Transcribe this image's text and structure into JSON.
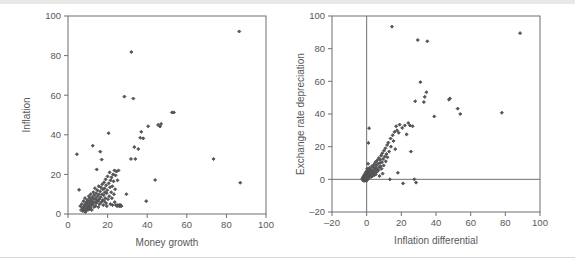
{
  "page": {
    "background": "#ffffff",
    "rule_color": "#e0e0e0",
    "text_color": "#58585a",
    "marker_color": "#545456"
  },
  "chart_data": [
    {
      "id": "money-growth-vs-inflation",
      "type": "scatter",
      "title": "",
      "xlabel": "Money growth",
      "ylabel": "Inflation",
      "xlim": [
        0,
        100
      ],
      "ylim": [
        0,
        100
      ],
      "xticks": [
        0,
        20,
        40,
        60,
        80,
        100
      ],
      "yticks": [
        0,
        20,
        40,
        60,
        80,
        100
      ],
      "grid": false,
      "legend": "none",
      "zero_lines": false,
      "points": [
        [
          4.5,
          30.2
        ],
        [
          5.6,
          12.2
        ],
        [
          6.2,
          4.0
        ],
        [
          6.6,
          2.0
        ],
        [
          7.0,
          5.0
        ],
        [
          7.3,
          3.0
        ],
        [
          7.5,
          1.5
        ],
        [
          7.8,
          6.5
        ],
        [
          8.0,
          3.5
        ],
        [
          8.2,
          2.0
        ],
        [
          8.4,
          4.5
        ],
        [
          8.6,
          8.0
        ],
        [
          8.8,
          1.0
        ],
        [
          9.0,
          5.5
        ],
        [
          9.1,
          3.0
        ],
        [
          9.3,
          2.5
        ],
        [
          9.5,
          6.0
        ],
        [
          9.6,
          4.0
        ],
        [
          9.8,
          7.0
        ],
        [
          10.0,
          2.0
        ],
        [
          10.1,
          5.0
        ],
        [
          10.3,
          3.5
        ],
        [
          10.5,
          9.0
        ],
        [
          10.6,
          6.5
        ],
        [
          10.8,
          4.0
        ],
        [
          10.9,
          2.5
        ],
        [
          11.0,
          8.0
        ],
        [
          11.2,
          5.5
        ],
        [
          11.4,
          3.0
        ],
        [
          11.5,
          10.0
        ],
        [
          11.7,
          7.0
        ],
        [
          11.8,
          4.5
        ],
        [
          12.0,
          2.0
        ],
        [
          12.2,
          6.0
        ],
        [
          12.3,
          8.5
        ],
        [
          12.5,
          34.5
        ],
        [
          12.6,
          5.0
        ],
        [
          12.8,
          11.0
        ],
        [
          13.0,
          7.5
        ],
        [
          13.1,
          3.5
        ],
        [
          13.3,
          9.5
        ],
        [
          13.5,
          6.0
        ],
        [
          13.6,
          13.0
        ],
        [
          13.8,
          4.0
        ],
        [
          14.0,
          8.0
        ],
        [
          14.2,
          10.5
        ],
        [
          14.3,
          5.5
        ],
        [
          14.5,
          22.5
        ],
        [
          14.6,
          7.0
        ],
        [
          14.8,
          12.0
        ],
        [
          15.0,
          9.0
        ],
        [
          15.2,
          6.5
        ],
        [
          15.3,
          3.5
        ],
        [
          15.5,
          14.0
        ],
        [
          15.6,
          10.0
        ],
        [
          15.8,
          7.5
        ],
        [
          16.0,
          5.0
        ],
        [
          16.2,
          11.5
        ],
        [
          16.3,
          31.5
        ],
        [
          16.5,
          8.5
        ],
        [
          16.6,
          13.5
        ],
        [
          16.8,
          6.0
        ],
        [
          17.0,
          27.5
        ],
        [
          17.2,
          10.0
        ],
        [
          17.3,
          15.0
        ],
        [
          17.5,
          7.0
        ],
        [
          17.6,
          12.5
        ],
        [
          17.8,
          4.5
        ],
        [
          18.0,
          9.5
        ],
        [
          18.2,
          16.0
        ],
        [
          18.3,
          6.5
        ],
        [
          18.5,
          13.0
        ],
        [
          18.6,
          11.0
        ],
        [
          18.8,
          8.0
        ],
        [
          19.0,
          17.5
        ],
        [
          19.2,
          5.5
        ],
        [
          19.3,
          14.5
        ],
        [
          19.5,
          10.5
        ],
        [
          19.6,
          4.0
        ],
        [
          19.8,
          12.0
        ],
        [
          20.0,
          19.0
        ],
        [
          20.2,
          7.5
        ],
        [
          20.5,
          40.8
        ],
        [
          20.6,
          15.5
        ],
        [
          20.8,
          9.0
        ],
        [
          21.0,
          21.0
        ],
        [
          21.2,
          13.5
        ],
        [
          21.4,
          5.0
        ],
        [
          21.5,
          17.0
        ],
        [
          21.8,
          11.0
        ],
        [
          22.0,
          18.5
        ],
        [
          22.2,
          8.0
        ],
        [
          22.4,
          14.0
        ],
        [
          22.5,
          4.5
        ],
        [
          22.8,
          20.0
        ],
        [
          23.0,
          16.5
        ],
        [
          23.2,
          10.0
        ],
        [
          23.5,
          22.0
        ],
        [
          23.6,
          6.0
        ],
        [
          23.8,
          12.5
        ],
        [
          24.0,
          19.5
        ],
        [
          24.2,
          4.5
        ],
        [
          24.5,
          21.5
        ],
        [
          24.8,
          4.0
        ],
        [
          25.0,
          17.0
        ],
        [
          25.2,
          4.5
        ],
        [
          25.5,
          22.0
        ],
        [
          25.8,
          4.0
        ],
        [
          26.0,
          4.5
        ],
        [
          26.3,
          4.0
        ],
        [
          26.6,
          4.5
        ],
        [
          27.0,
          4.0
        ],
        [
          28.5,
          59.3
        ],
        [
          29.5,
          10.0
        ],
        [
          31.8,
          27.8
        ],
        [
          32.0,
          81.8
        ],
        [
          33.0,
          58.3
        ],
        [
          33.5,
          33.8
        ],
        [
          34.0,
          27.8
        ],
        [
          35.5,
          32.8
        ],
        [
          36.5,
          38.5
        ],
        [
          37.0,
          41.5
        ],
        [
          38.0,
          38.2
        ],
        [
          39.5,
          6.5
        ],
        [
          40.5,
          44.3
        ],
        [
          44.0,
          17.2
        ],
        [
          45.5,
          45.0
        ],
        [
          46.5,
          44.2
        ],
        [
          47.0,
          45.5
        ],
        [
          52.5,
          51.3
        ],
        [
          53.5,
          51.3
        ],
        [
          73.5,
          27.8
        ],
        [
          86.5,
          92.2
        ],
        [
          87.0,
          15.8
        ]
      ]
    },
    {
      "id": "inflation-differential-vs-depreciation",
      "type": "scatter",
      "title": "",
      "xlabel": "Inflation differential",
      "ylabel": "Exchange rate depreciation",
      "xlim": [
        -20,
        100
      ],
      "ylim": [
        -20,
        100
      ],
      "xticks": [
        -20,
        0,
        20,
        40,
        60,
        80,
        100
      ],
      "yticks": [
        -20,
        0,
        20,
        40,
        60,
        80,
        100
      ],
      "grid": false,
      "legend": "none",
      "zero_lines": true,
      "points": [
        [
          -2.5,
          0.5
        ],
        [
          -2.2,
          -0.5
        ],
        [
          -2.0,
          1.5
        ],
        [
          -1.8,
          0.0
        ],
        [
          -1.6,
          2.0
        ],
        [
          -1.5,
          -1.0
        ],
        [
          -1.3,
          1.0
        ],
        [
          -1.2,
          3.0
        ],
        [
          -1.0,
          0.5
        ],
        [
          -0.9,
          -0.5
        ],
        [
          -0.8,
          2.5
        ],
        [
          -0.7,
          4.0
        ],
        [
          -0.6,
          1.5
        ],
        [
          -0.5,
          0.0
        ],
        [
          -0.4,
          3.5
        ],
        [
          -0.3,
          2.0
        ],
        [
          -0.2,
          -1.0
        ],
        [
          -0.1,
          5.0
        ],
        [
          0.0,
          1.0
        ],
        [
          0.1,
          3.0
        ],
        [
          0.2,
          0.5
        ],
        [
          0.3,
          6.5
        ],
        [
          0.4,
          2.5
        ],
        [
          0.5,
          4.5
        ],
        [
          0.6,
          1.5
        ],
        [
          0.7,
          0.0
        ],
        [
          0.8,
          9.5
        ],
        [
          0.9,
          3.5
        ],
        [
          1.0,
          22.3
        ],
        [
          1.1,
          2.0
        ],
        [
          1.2,
          5.5
        ],
        [
          1.3,
          1.0
        ],
        [
          1.4,
          31.3
        ],
        [
          1.5,
          4.0
        ],
        [
          1.6,
          7.0
        ],
        [
          1.8,
          2.5
        ],
        [
          2.0,
          5.0
        ],
        [
          2.2,
          3.0
        ],
        [
          2.4,
          6.0
        ],
        [
          2.6,
          1.5
        ],
        [
          2.8,
          4.5
        ],
        [
          3.0,
          8.0
        ],
        [
          3.2,
          2.0
        ],
        [
          3.4,
          5.5
        ],
        [
          3.6,
          3.5
        ],
        [
          3.8,
          7.5
        ],
        [
          4.0,
          4.0
        ],
        [
          4.2,
          9.0
        ],
        [
          4.4,
          2.5
        ],
        [
          4.6,
          6.5
        ],
        [
          4.8,
          5.0
        ],
        [
          5.0,
          10.5
        ],
        [
          5.2,
          3.0
        ],
        [
          5.4,
          7.0
        ],
        [
          5.6,
          8.5
        ],
        [
          5.8,
          4.5
        ],
        [
          6.0,
          11.5
        ],
        [
          6.2,
          6.0
        ],
        [
          6.5,
          9.5
        ],
        [
          6.8,
          5.5
        ],
        [
          7.0,
          13.0
        ],
        [
          7.2,
          7.5
        ],
        [
          7.4,
          2.0
        ],
        [
          7.6,
          10.0
        ],
        [
          7.8,
          12.0
        ],
        [
          8.0,
          8.0
        ],
        [
          8.3,
          14.5
        ],
        [
          8.6,
          6.5
        ],
        [
          8.8,
          10.5
        ],
        [
          9.0,
          16.0
        ],
        [
          9.2,
          3.5
        ],
        [
          9.5,
          12.5
        ],
        [
          9.8,
          8.5
        ],
        [
          10.0,
          17.5
        ],
        [
          10.4,
          14.0
        ],
        [
          10.8,
          19.0
        ],
        [
          11.0,
          11.0
        ],
        [
          11.4,
          15.5
        ],
        [
          11.8,
          21.0
        ],
        [
          12.0,
          13.5
        ],
        [
          12.5,
          22.5
        ],
        [
          13.0,
          17.0
        ],
        [
          13.4,
          0.0
        ],
        [
          13.8,
          25.0
        ],
        [
          14.0,
          20.0
        ],
        [
          14.6,
          93.5
        ],
        [
          15.0,
          27.0
        ],
        [
          15.5,
          23.5
        ],
        [
          16.0,
          29.0
        ],
        [
          16.5,
          18.5
        ],
        [
          17.0,
          32.5
        ],
        [
          17.5,
          30.0
        ],
        [
          18.0,
          4.0
        ],
        [
          18.5,
          28.5
        ],
        [
          19.0,
          33.5
        ],
        [
          20.5,
          31.5
        ],
        [
          21.0,
          -2.5
        ],
        [
          22.0,
          33.0
        ],
        [
          23.0,
          27.5
        ],
        [
          24.0,
          34.5
        ],
        [
          25.0,
          33.0
        ],
        [
          25.5,
          17.0
        ],
        [
          26.5,
          32.5
        ],
        [
          27.5,
          0.0
        ],
        [
          28.0,
          47.8
        ],
        [
          28.5,
          -2.0
        ],
        [
          29.5,
          85.3
        ],
        [
          31.0,
          59.5
        ],
        [
          33.0,
          47.3
        ],
        [
          33.5,
          50.5
        ],
        [
          34.5,
          53.3
        ],
        [
          35.0,
          84.5
        ],
        [
          39.0,
          38.5
        ],
        [
          47.5,
          48.8
        ],
        [
          48.0,
          49.5
        ],
        [
          52.5,
          43.3
        ],
        [
          54.0,
          40.0
        ],
        [
          78.0,
          40.8
        ],
        [
          88.5,
          89.5
        ]
      ]
    }
  ]
}
